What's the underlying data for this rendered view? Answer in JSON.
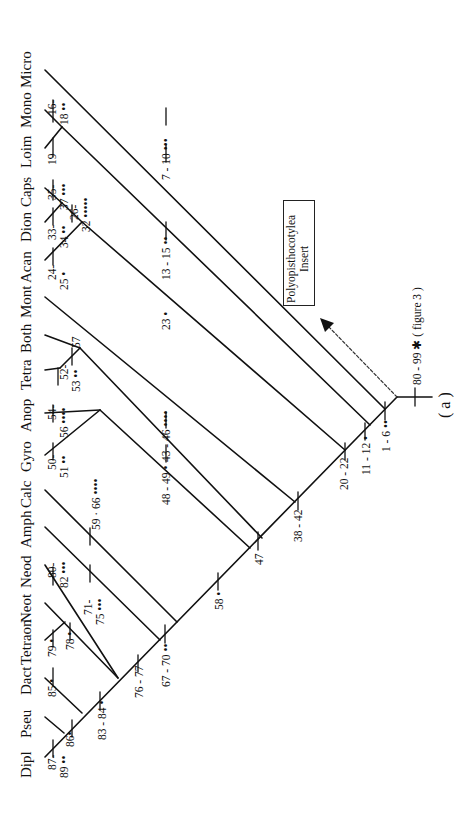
{
  "diagram": {
    "type": "cladogram",
    "orientation": "rotated-90",
    "taxa": [
      "Dipl",
      "Pseu",
      "Dact",
      "Tetraon",
      "Neot",
      "Neod",
      "Amph",
      "Calc",
      "Gyro",
      "Anop",
      "Tetra",
      "Both",
      "Mont",
      "Acan",
      "Dion",
      "Caps",
      "Loim",
      "Mono",
      "Micro"
    ],
    "character_labels": {
      "dipl": "87-\n89 ••",
      "dipl_a": "87-",
      "dipl_b": "89 ••",
      "pseu_dipl": "86•",
      "pseu": "85 •",
      "tetraon": "79 •",
      "tetraon_neot": "78 •",
      "neod_a": "80-",
      "neod_b": "82 •••",
      "neod_neot_a": "71-",
      "neod_neot_b": "75 •••",
      "base_dact": "83 - 84 •",
      "base_neot": "76 - 77",
      "base_amph": "67 - 70 ••",
      "calc": "59 · 66 ••••",
      "base_calc": "58 •",
      "gyro_a": "50-",
      "gyro_b": "51 ••",
      "anop_a": "54-",
      "anop_b": "56 ••••",
      "tetra_a": "52-",
      "tetra_b": "53 ••",
      "both": "57",
      "gyro_clade": "48 - 49 •",
      "tetra_clade": "43 - 46 ••••",
      "base_gyro": "47",
      "base_mont": "38 - 42",
      "mont": "23 •",
      "base_acan": "20 - 22",
      "acan_a": "24-",
      "acan_b": "25 •",
      "dion_a": "33-",
      "dion_b": "34 ••",
      "caps_a": "35-",
      "caps_b": "37 •••",
      "caps_dion_a": "26-",
      "caps_dion_b": "32 •••••",
      "loim": "19",
      "mono_a": "16-",
      "mono_b": "18 ••",
      "acan_clade": "13 - 15 ••",
      "base_loim": "11 - 12 •",
      "micro_side": "7 - 10 •••",
      "base_micro": "1 - 6 ••",
      "root": "80 - 99 ✱ ( figure 3 )"
    },
    "insert_box": {
      "line1": "Polyopisthocotylea",
      "line2": "Insert"
    },
    "node_label": "( a )"
  }
}
